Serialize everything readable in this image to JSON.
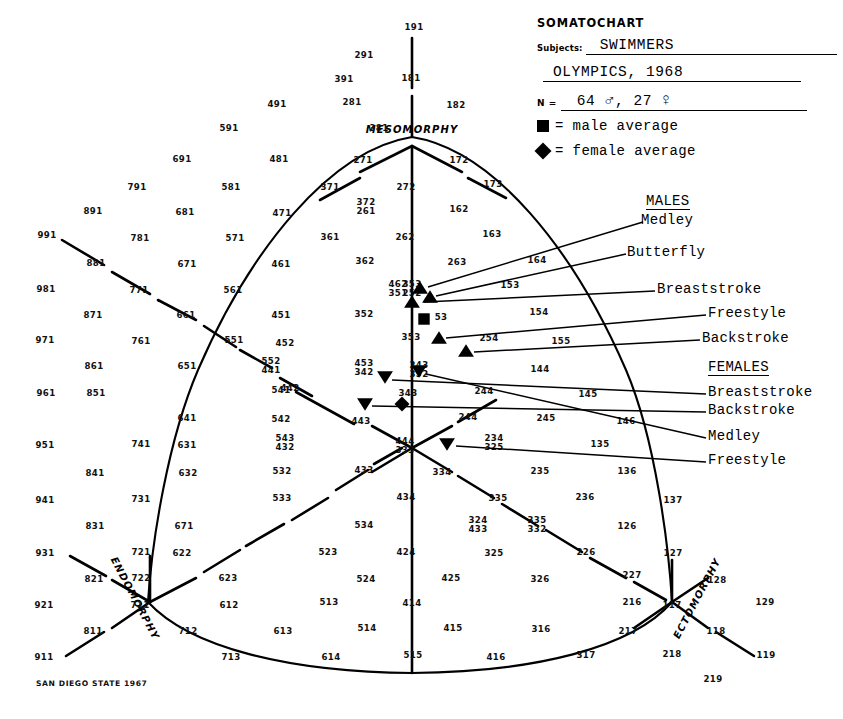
{
  "header": {
    "title": "SOMATOCHART",
    "subjects_label": "Subjects:",
    "subjects_value": "SWIMMERS",
    "event_value": "OLYMPICS, 1968",
    "n_label": "N =",
    "n_males": "64",
    "male_symbol": "♂",
    "n_comma": ",",
    "n_females": "27",
    "female_symbol": "♀",
    "key_male": "= male average",
    "key_female": "= female average"
  },
  "groups": {
    "males_header": "MALES",
    "females_header": "FEMALES"
  },
  "series_labels": {
    "m_medley": "Medley",
    "m_butterfly": "Butterfly",
    "m_breaststroke": "Breaststroke",
    "m_freestyle": "Freestyle",
    "m_backstroke": "Backstroke",
    "f_breaststroke": "Breaststroke",
    "f_backstroke": "Backstroke",
    "f_medley": "Medley",
    "f_freestyle": "Freestyle"
  },
  "axes": {
    "mesomorphy": "MESOMORPHY",
    "endomorphy": "ENDOMORPHY",
    "ectomorphy": "ECTOMORPHY"
  },
  "credit": "SAN DIEGO STATE 1967",
  "chart_data": {
    "type": "scatter",
    "title": "SOMATOCHART",
    "subtitle": "SWIMMERS — OLYMPICS, 1968",
    "xlabel": "ENDOMORPHY ↔ ECTOMORPHY",
    "ylabel": "MESOMORPHY",
    "grid": false,
    "legend_position": "top-right",
    "n_males": 64,
    "n_females": 27,
    "marker_legend": [
      {
        "shape": "square",
        "meaning": "male average"
      },
      {
        "shape": "diamond",
        "meaning": "female average"
      }
    ],
    "series": [
      {
        "name": "Medley",
        "group": "MALES",
        "marker": "triangle-up",
        "somatotype": "2-5-3",
        "x": 420,
        "y": 288
      },
      {
        "name": "Butterfly",
        "group": "MALES",
        "marker": "triangle-up",
        "somatotype": "2-5-3",
        "x": 430,
        "y": 297
      },
      {
        "name": "Breaststroke",
        "group": "MALES",
        "marker": "triangle-up",
        "somatotype": "2-5-2",
        "x": 412,
        "y": 302
      },
      {
        "name": "Freestyle",
        "group": "MALES",
        "marker": "triangle-up",
        "somatotype": "2-5-3",
        "x": 439,
        "y": 338
      },
      {
        "name": "Backstroke",
        "group": "MALES",
        "marker": "triangle-up",
        "somatotype": "2-5-4",
        "x": 466,
        "y": 351
      },
      {
        "name": "male average",
        "group": "MALES",
        "marker": "square",
        "somatotype": "2-5-3",
        "x": 424,
        "y": 319
      },
      {
        "name": "Breaststroke",
        "group": "FEMALES",
        "marker": "triangle-down",
        "somatotype": "3-4-3",
        "x": 419,
        "y": 371
      },
      {
        "name": "Backstroke",
        "group": "FEMALES",
        "marker": "triangle-down",
        "somatotype": "3-4-2",
        "x": 385,
        "y": 377
      },
      {
        "name": "Medley",
        "group": "FEMALES",
        "marker": "triangle-down",
        "somatotype": "4-4-3",
        "x": 365,
        "y": 404
      },
      {
        "name": "Freestyle",
        "group": "FEMALES",
        "marker": "triangle-down",
        "somatotype": "3-3-4",
        "x": 447,
        "y": 444
      },
      {
        "name": "female average",
        "group": "FEMALES",
        "marker": "diamond",
        "somatotype": "3-4-3",
        "x": 402,
        "y": 404
      }
    ],
    "grid_numbers": [
      {
        "t": "191",
        "x": 414,
        "y": 30
      },
      {
        "t": "291",
        "x": 364,
        "y": 58
      },
      {
        "t": "391",
        "x": 344,
        "y": 82
      },
      {
        "t": "181",
        "x": 411,
        "y": 81
      },
      {
        "t": "281",
        "x": 352,
        "y": 105
      },
      {
        "t": "182",
        "x": 456,
        "y": 108
      },
      {
        "t": "491",
        "x": 277,
        "y": 107
      },
      {
        "t": "591",
        "x": 229,
        "y": 131
      },
      {
        "t": "381",
        "x": 379,
        "y": 131
      },
      {
        "t": "691",
        "x": 182,
        "y": 162
      },
      {
        "t": "481",
        "x": 279,
        "y": 162
      },
      {
        "t": "271",
        "x": 363,
        "y": 163
      },
      {
        "t": "172",
        "x": 459,
        "y": 163
      },
      {
        "t": "791",
        "x": 137,
        "y": 190
      },
      {
        "t": "581",
        "x": 231,
        "y": 190
      },
      {
        "t": "371",
        "x": 330,
        "y": 190
      },
      {
        "t": "272",
        "x": 406,
        "y": 190
      },
      {
        "t": "173",
        "x": 493,
        "y": 187
      },
      {
        "t": "891",
        "x": 93,
        "y": 214
      },
      {
        "t": "681",
        "x": 185,
        "y": 215
      },
      {
        "t": "471",
        "x": 282,
        "y": 216
      },
      {
        "t": "372",
        "x": 366,
        "y": 205
      },
      {
        "t": "261",
        "x": 366,
        "y": 214
      },
      {
        "t": "162",
        "x": 459,
        "y": 212
      },
      {
        "t": "991",
        "x": 47,
        "y": 238
      },
      {
        "t": "781",
        "x": 140,
        "y": 241
      },
      {
        "t": "571",
        "x": 235,
        "y": 241
      },
      {
        "t": "361",
        "x": 330,
        "y": 240
      },
      {
        "t": "262",
        "x": 405,
        "y": 240
      },
      {
        "t": "163",
        "x": 492,
        "y": 237
      },
      {
        "t": "881",
        "x": 96,
        "y": 266
      },
      {
        "t": "671",
        "x": 187,
        "y": 267
      },
      {
        "t": "461",
        "x": 281,
        "y": 267
      },
      {
        "t": "362",
        "x": 365,
        "y": 264
      },
      {
        "t": "263",
        "x": 457,
        "y": 265
      },
      {
        "t": "164",
        "x": 537,
        "y": 263
      },
      {
        "t": "981",
        "x": 46,
        "y": 292
      },
      {
        "t": "771",
        "x": 139,
        "y": 293
      },
      {
        "t": "561",
        "x": 233,
        "y": 293
      },
      {
        "t": "462",
        "x": 398,
        "y": 287
      },
      {
        "t": "351",
        "x": 398,
        "y": 296
      },
      {
        "t": "353",
        "x": 412,
        "y": 287
      },
      {
        "t": "252",
        "x": 412,
        "y": 296
      },
      {
        "t": "153",
        "x": 510,
        "y": 288
      },
      {
        "t": "871",
        "x": 93,
        "y": 318
      },
      {
        "t": "661",
        "x": 186,
        "y": 318
      },
      {
        "t": "451",
        "x": 281,
        "y": 318
      },
      {
        "t": "352",
        "x": 364,
        "y": 317
      },
      {
        "t": "53",
        "x": 441,
        "y": 320
      },
      {
        "t": "154",
        "x": 539,
        "y": 315
      },
      {
        "t": "971",
        "x": 45,
        "y": 343
      },
      {
        "t": "761",
        "x": 141,
        "y": 344
      },
      {
        "t": "551",
        "x": 234,
        "y": 343
      },
      {
        "t": "452",
        "x": 285,
        "y": 346
      },
      {
        "t": "353",
        "x": 411,
        "y": 340
      },
      {
        "t": "254",
        "x": 489,
        "y": 341
      },
      {
        "t": "155",
        "x": 561,
        "y": 344
      },
      {
        "t": "861",
        "x": 94,
        "y": 369
      },
      {
        "t": "651",
        "x": 187,
        "y": 369
      },
      {
        "t": "552",
        "x": 271,
        "y": 364
      },
      {
        "t": "441",
        "x": 271,
        "y": 373
      },
      {
        "t": "442",
        "x": 290,
        "y": 391
      },
      {
        "t": "453",
        "x": 364,
        "y": 366
      },
      {
        "t": "342",
        "x": 364,
        "y": 375
      },
      {
        "t": "243",
        "x": 419,
        "y": 368
      },
      {
        "t": "352",
        "x": 419,
        "y": 377
      },
      {
        "t": "144",
        "x": 540,
        "y": 372
      },
      {
        "t": "961",
        "x": 46,
        "y": 396
      },
      {
        "t": "851",
        "x": 96,
        "y": 396
      },
      {
        "t": "541",
        "x": 281,
        "y": 393
      },
      {
        "t": "343",
        "x": 408,
        "y": 396
      },
      {
        "t": "244",
        "x": 484,
        "y": 394
      },
      {
        "t": "145",
        "x": 588,
        "y": 397
      },
      {
        "t": "951",
        "x": 45,
        "y": 448
      },
      {
        "t": "741",
        "x": 141,
        "y": 447
      },
      {
        "t": "641",
        "x": 187,
        "y": 421
      },
      {
        "t": "542",
        "x": 281,
        "y": 422
      },
      {
        "t": "443",
        "x": 361,
        "y": 424
      },
      {
        "t": "244",
        "x": 468,
        "y": 420
      },
      {
        "t": "245",
        "x": 546,
        "y": 421
      },
      {
        "t": "146",
        "x": 626,
        "y": 424
      },
      {
        "t": "841",
        "x": 95,
        "y": 476
      },
      {
        "t": "631",
        "x": 187,
        "y": 448
      },
      {
        "t": "543",
        "x": 285,
        "y": 441
      },
      {
        "t": "432",
        "x": 285,
        "y": 450
      },
      {
        "t": "444",
        "x": 405,
        "y": 444
      },
      {
        "t": "333",
        "x": 405,
        "y": 453
      },
      {
        "t": "234",
        "x": 494,
        "y": 441
      },
      {
        "t": "325",
        "x": 494,
        "y": 450
      },
      {
        "t": "135",
        "x": 600,
        "y": 447
      },
      {
        "t": "941",
        "x": 45,
        "y": 503
      },
      {
        "t": "731",
        "x": 141,
        "y": 502
      },
      {
        "t": "632",
        "x": 188,
        "y": 476
      },
      {
        "t": "532",
        "x": 282,
        "y": 474
      },
      {
        "t": "433",
        "x": 364,
        "y": 473
      },
      {
        "t": "334",
        "x": 442,
        "y": 475
      },
      {
        "t": "235",
        "x": 540,
        "y": 474
      },
      {
        "t": "136",
        "x": 627,
        "y": 474
      },
      {
        "t": "831",
        "x": 95,
        "y": 529
      },
      {
        "t": "671",
        "x": 184,
        "y": 529
      },
      {
        "t": "533",
        "x": 282,
        "y": 501
      },
      {
        "t": "434",
        "x": 406,
        "y": 500
      },
      {
        "t": "335",
        "x": 498,
        "y": 501
      },
      {
        "t": "236",
        "x": 585,
        "y": 500
      },
      {
        "t": "137",
        "x": 673,
        "y": 503
      },
      {
        "t": "931",
        "x": 45,
        "y": 556
      },
      {
        "t": "721",
        "x": 141,
        "y": 555
      },
      {
        "t": "622",
        "x": 182,
        "y": 556
      },
      {
        "t": "534",
        "x": 364,
        "y": 528
      },
      {
        "t": "324",
        "x": 478,
        "y": 523
      },
      {
        "t": "433",
        "x": 478,
        "y": 532
      },
      {
        "t": "335",
        "x": 537,
        "y": 523
      },
      {
        "t": "332",
        "x": 537,
        "y": 532
      },
      {
        "t": "126",
        "x": 627,
        "y": 529
      },
      {
        "t": "127",
        "x": 673,
        "y": 556
      },
      {
        "t": "821",
        "x": 94,
        "y": 582
      },
      {
        "t": "722",
        "x": 141,
        "y": 581
      },
      {
        "t": "623",
        "x": 228,
        "y": 581
      },
      {
        "t": "523",
        "x": 328,
        "y": 555
      },
      {
        "t": "424",
        "x": 406,
        "y": 555
      },
      {
        "t": "325",
        "x": 494,
        "y": 556
      },
      {
        "t": "226",
        "x": 586,
        "y": 555
      },
      {
        "t": "227",
        "x": 632,
        "y": 578
      },
      {
        "t": "128",
        "x": 717,
        "y": 583
      },
      {
        "t": "921",
        "x": 44,
        "y": 608
      },
      {
        "t": "711",
        "x": 140,
        "y": 608
      },
      {
        "t": "612",
        "x": 229,
        "y": 608
      },
      {
        "t": "513",
        "x": 329,
        "y": 605
      },
      {
        "t": "524",
        "x": 366,
        "y": 582
      },
      {
        "t": "425",
        "x": 451,
        "y": 581
      },
      {
        "t": "326",
        "x": 540,
        "y": 582
      },
      {
        "t": "216",
        "x": 632,
        "y": 605
      },
      {
        "t": "117",
        "x": 672,
        "y": 608
      },
      {
        "t": "129",
        "x": 765,
        "y": 605
      },
      {
        "t": "811",
        "x": 93,
        "y": 634
      },
      {
        "t": "712",
        "x": 188,
        "y": 634
      },
      {
        "t": "613",
        "x": 283,
        "y": 634
      },
      {
        "t": "514",
        "x": 367,
        "y": 631
      },
      {
        "t": "414",
        "x": 412,
        "y": 606
      },
      {
        "t": "415",
        "x": 453,
        "y": 631
      },
      {
        "t": "316",
        "x": 541,
        "y": 632
      },
      {
        "t": "217",
        "x": 628,
        "y": 634
      },
      {
        "t": "118",
        "x": 716,
        "y": 634
      },
      {
        "t": "911",
        "x": 44,
        "y": 660
      },
      {
        "t": "713",
        "x": 231,
        "y": 660
      },
      {
        "t": "614",
        "x": 331,
        "y": 660
      },
      {
        "t": "515",
        "x": 413,
        "y": 658
      },
      {
        "t": "416",
        "x": 496,
        "y": 660
      },
      {
        "t": "317",
        "x": 586,
        "y": 658
      },
      {
        "t": "218",
        "x": 672,
        "y": 657
      },
      {
        "t": "119",
        "x": 766,
        "y": 658
      },
      {
        "t": "219",
        "x": 713,
        "y": 682
      }
    ]
  }
}
